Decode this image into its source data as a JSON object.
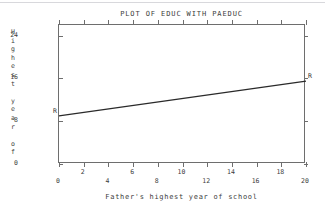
{
  "chart_data": {
    "type": "line",
    "title": "PLOT OF EDUC WITH PAEDUC",
    "xlabel": "Father's highest year of school",
    "ylabel": "Highest year of",
    "ylabel_chars": [
      "H",
      "i",
      "g",
      "h",
      "e",
      "s",
      "t",
      "",
      "y",
      "e",
      "a",
      "r",
      "",
      "o",
      "f"
    ],
    "xlim": [
      0,
      20
    ],
    "ylim": [
      0,
      26
    ],
    "xticks": [
      0,
      2,
      4,
      6,
      8,
      10,
      12,
      14,
      16,
      18,
      20
    ],
    "xtick_labels": [
      "0",
      "2",
      "4",
      "6",
      "8",
      "10",
      "12",
      "14",
      "16",
      "18",
      "20"
    ],
    "yticks": [
      0,
      8,
      16,
      24
    ],
    "ytick_labels": [
      "0",
      "8",
      "16",
      "24"
    ],
    "grid": false,
    "legend": "none",
    "series": [
      {
        "name": "R",
        "marker": "R",
        "x": [
          0,
          20
        ],
        "y": [
          9.0,
          15.5
        ]
      }
    ],
    "annotations": [
      {
        "text": "R",
        "x": 0,
        "y": 9.0,
        "placement": "left-inside"
      },
      {
        "text": "R",
        "x": 20,
        "y": 15.5,
        "placement": "right-outside"
      }
    ],
    "colors": {
      "line": "#2a2a2a",
      "axis": "#6e6e6e",
      "text": "#3d3d3d",
      "background": "#ffffff"
    }
  }
}
